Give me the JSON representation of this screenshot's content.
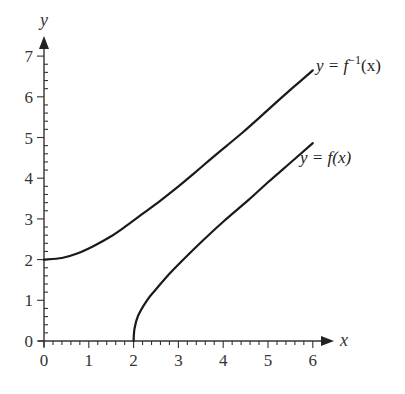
{
  "chart_data": {
    "type": "line",
    "title": "",
    "xlabel": "x",
    "ylabel": "y",
    "xlim": [
      0,
      6
    ],
    "ylim": [
      0,
      7
    ],
    "x_ticks": [
      "0",
      "1",
      "2",
      "3",
      "4",
      "5",
      "6"
    ],
    "y_ticks": [
      "0",
      "1",
      "2",
      "3",
      "4",
      "5",
      "6",
      "7"
    ],
    "minor_ticks_per_unit": 5,
    "grid": false,
    "legend": "none (curves labelled inline)",
    "series": [
      {
        "name": "y = f(x)",
        "label": "y = f(x)",
        "points": [
          [
            2,
            0
          ],
          [
            2.02,
            0.3
          ],
          [
            2.1,
            0.62
          ],
          [
            2.3,
            1.0
          ],
          [
            2.5,
            1.27
          ],
          [
            2.8,
            1.65
          ],
          [
            3,
            1.88
          ],
          [
            3.5,
            2.42
          ],
          [
            4,
            2.93
          ],
          [
            4.56,
            3.46
          ],
          [
            5,
            3.9
          ],
          [
            5.5,
            4.38
          ],
          [
            6,
            4.86
          ]
        ]
      },
      {
        "name": "y = f^-1(x)",
        "label": "y = f⁻¹(x)",
        "points": [
          [
            0,
            2.0
          ],
          [
            0.4,
            2.04
          ],
          [
            0.74,
            2.15
          ],
          [
            1.1,
            2.33
          ],
          [
            1.48,
            2.56
          ],
          [
            1.85,
            2.84
          ],
          [
            2.22,
            3.14
          ],
          [
            2.6,
            3.45
          ],
          [
            2.96,
            3.76
          ],
          [
            3.33,
            4.1
          ],
          [
            3.7,
            4.45
          ],
          [
            4.07,
            4.79
          ],
          [
            4.44,
            5.13
          ],
          [
            4.82,
            5.5
          ],
          [
            5.19,
            5.87
          ],
          [
            5.56,
            6.23
          ],
          [
            5.93,
            6.58
          ],
          [
            6,
            6.65
          ]
        ]
      }
    ]
  },
  "labels": {
    "x_axis": "x",
    "y_axis": "y",
    "curve_f": "y = f(x)",
    "curve_finv_prefix": "y = f",
    "curve_finv_sup": "−1",
    "curve_finv_suffix": "(x)"
  }
}
